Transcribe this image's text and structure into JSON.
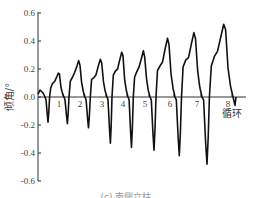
{
  "chart_data": {
    "type": "line",
    "title": "",
    "xlabel": "循环",
    "ylabel": "倾角/°",
    "ylim": [
      -0.6,
      0.6
    ],
    "yticks": [
      "0.6",
      "0.4",
      "0.2",
      "0.0",
      "-0.2",
      "-0.4",
      "-0.6"
    ],
    "xticks": [
      "1",
      "2",
      "3",
      "4",
      "5",
      "6",
      "7",
      "8"
    ],
    "grid": false,
    "legend": null,
    "caption": "(c) 南侧立柱",
    "series": [
      {
        "name": "倾角",
        "cycles": [
          1,
          2,
          3,
          4,
          5,
          6,
          7,
          8
        ],
        "peak_values": [
          0.17,
          0.26,
          0.27,
          0.32,
          0.33,
          0.42,
          0.46,
          0.52
        ],
        "trough_values": [
          -0.18,
          -0.19,
          -0.22,
          -0.33,
          -0.36,
          -0.38,
          -0.42,
          -0.48
        ],
        "initial_value": 0.05
      }
    ]
  }
}
